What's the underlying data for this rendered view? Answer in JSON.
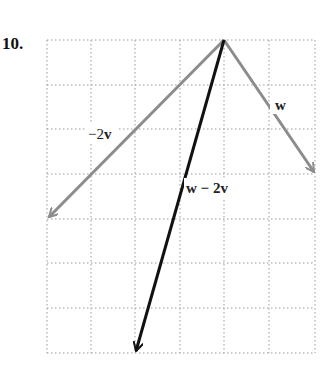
{
  "problem_number": "10.",
  "grid": {
    "columns": 6,
    "rows": 7,
    "x0": 47,
    "y0": 40,
    "cell_w": 44.7,
    "cell_h": 44.7,
    "line_color": "#999999"
  },
  "vectors": [
    {
      "name": "w",
      "label": "w",
      "from": [
        0,
        0
      ],
      "to": [
        2,
        -3
      ],
      "color": "#8c8c8c"
    },
    {
      "name": "-2v",
      "label": "−2v",
      "from": [
        0,
        0
      ],
      "to": [
        -4,
        -4
      ],
      "color": "#8c8c8c"
    },
    {
      "name": "w-2v",
      "label": "w − 2v",
      "from": [
        0,
        0
      ],
      "to": [
        -2,
        -7
      ],
      "color": "#111111"
    }
  ],
  "labels": {
    "w": "w",
    "neg2v_minus": "−2",
    "neg2v_v": "v",
    "diff": "w − 2v"
  }
}
